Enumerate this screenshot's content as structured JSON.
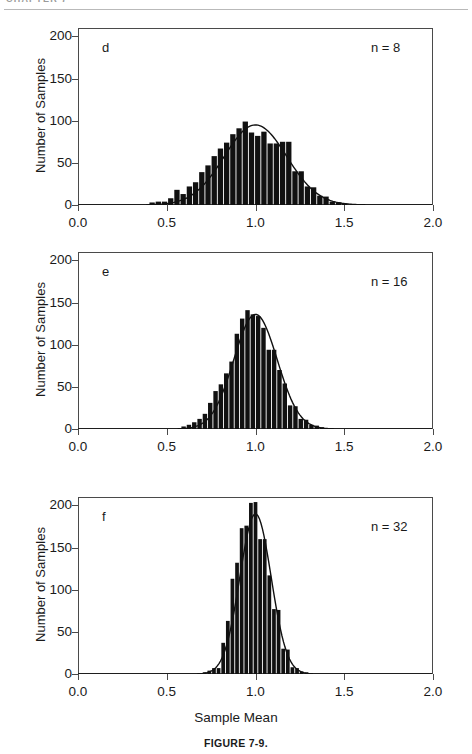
{
  "header": {
    "running_head": "CHAPTER 7"
  },
  "figure": {
    "caption": "FIGURE 7-9.",
    "x_axis_title": "Sample Mean",
    "y_axis_title": "Number of Samples"
  },
  "axes": {
    "x_ticks": [
      "0.0",
      "0.5",
      "1.0",
      "1.5",
      "2.0"
    ],
    "x_tick_values": [
      0.0,
      0.5,
      1.0,
      1.5,
      2.0
    ],
    "y_ticks": [
      "0",
      "50",
      "100",
      "150",
      "200"
    ],
    "y_tick_values": [
      0,
      50,
      100,
      150,
      200
    ],
    "xlim": [
      0.0,
      2.0
    ],
    "ylim": [
      0,
      210
    ]
  },
  "panels": [
    {
      "letter": "d",
      "n_label": "n = 8"
    },
    {
      "letter": "e",
      "n_label": "n = 16"
    },
    {
      "letter": "f",
      "n_label": "n = 32"
    }
  ],
  "chart_data": [
    {
      "type": "bar",
      "id": "panel-d",
      "title": "",
      "panel_letter": "d",
      "annotation": "n = 8",
      "xlabel": "Sample Mean",
      "ylabel": "Number of Samples",
      "xlim": [
        0.0,
        2.0
      ],
      "ylim": [
        0,
        210
      ],
      "grid": false,
      "legend": "none",
      "bin_width": 0.035,
      "bin_centers": [
        0.4175,
        0.4525,
        0.4875,
        0.5225,
        0.5575,
        0.5925,
        0.6275,
        0.6625,
        0.6975,
        0.7325,
        0.7675,
        0.8025,
        0.8375,
        0.8725,
        0.9075,
        0.9425,
        0.9775,
        1.0125,
        1.0475,
        1.0825,
        1.1175,
        1.1525,
        1.1875,
        1.2225,
        1.2575,
        1.2925,
        1.3275,
        1.3625,
        1.3975,
        1.4325,
        1.4675,
        1.5025
      ],
      "values": [
        3,
        4,
        4,
        8,
        18,
        13,
        22,
        27,
        39,
        47,
        58,
        67,
        74,
        84,
        91,
        99,
        86,
        82,
        87,
        73,
        73,
        75,
        75,
        40,
        40,
        22,
        21,
        11,
        10,
        4,
        3,
        2
      ],
      "curve": {
        "type": "normal",
        "mean": 1.0,
        "sigma": 0.176,
        "peak": 95
      }
    },
    {
      "type": "bar",
      "id": "panel-e",
      "title": "",
      "panel_letter": "e",
      "annotation": "n = 16",
      "xlabel": "Sample Mean",
      "ylabel": "Number of Samples",
      "xlim": [
        0.0,
        2.0
      ],
      "ylim": [
        0,
        210
      ],
      "grid": false,
      "legend": "none",
      "bin_width": 0.03,
      "bin_centers": [
        0.595,
        0.625,
        0.655,
        0.685,
        0.715,
        0.745,
        0.775,
        0.805,
        0.835,
        0.865,
        0.895,
        0.925,
        0.955,
        0.985,
        1.015,
        1.045,
        1.075,
        1.105,
        1.135,
        1.165,
        1.195,
        1.225,
        1.255,
        1.285,
        1.315,
        1.345,
        1.375,
        1.405
      ],
      "values": [
        3,
        5,
        8,
        12,
        18,
        31,
        45,
        53,
        66,
        80,
        113,
        131,
        141,
        136,
        134,
        120,
        94,
        94,
        70,
        54,
        28,
        27,
        12,
        11,
        5,
        4,
        2,
        1
      ],
      "curve": {
        "type": "normal",
        "mean": 1.0,
        "sigma": 0.122,
        "peak": 136
      }
    },
    {
      "type": "bar",
      "id": "panel-f",
      "title": "",
      "panel_letter": "f",
      "annotation": "n = 32",
      "xlabel": "Sample Mean",
      "ylabel": "Number of Samples",
      "xlim": [
        0.0,
        2.0
      ],
      "ylim": [
        0,
        210
      ],
      "grid": false,
      "legend": "none",
      "bin_width": 0.026,
      "bin_centers": [
        0.714,
        0.74,
        0.766,
        0.792,
        0.818,
        0.844,
        0.87,
        0.896,
        0.922,
        0.948,
        0.974,
        1.0,
        1.026,
        1.052,
        1.078,
        1.104,
        1.13,
        1.156,
        1.182,
        1.208,
        1.234,
        1.26,
        1.286
      ],
      "values": [
        2,
        4,
        7,
        7,
        37,
        63,
        113,
        132,
        173,
        176,
        203,
        204,
        160,
        160,
        117,
        77,
        76,
        30,
        29,
        8,
        7,
        3,
        2
      ],
      "curve": {
        "type": "normal",
        "mean": 1.0,
        "sigma": 0.088,
        "peak": 190
      }
    }
  ]
}
